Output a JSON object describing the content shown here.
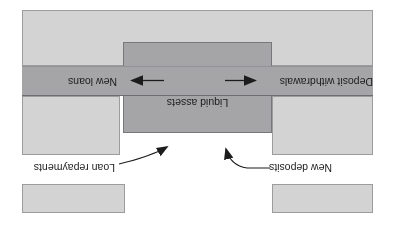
{
  "figure": {
    "labels": {
      "liquid_assets": "Liquid assets",
      "new_loans": "New loans",
      "deposit_withdrawals": "Deposit withdrawals",
      "loan_repayments": "Loan repayments",
      "new_deposits": "New deposits"
    },
    "colors": {
      "light_gray": "#d3d3d3",
      "dark_gray": "#a5a5a7",
      "ink": "#1c1c1c"
    }
  }
}
